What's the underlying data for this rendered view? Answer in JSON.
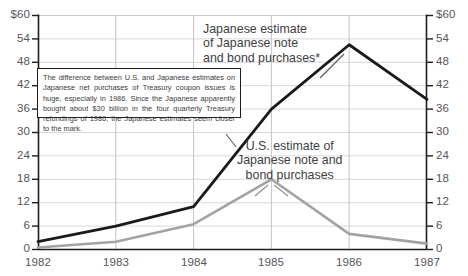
{
  "chart_data": {
    "type": "line",
    "title": "",
    "xlabel": "",
    "ylabel": "",
    "categories": [
      "1982",
      "1983",
      "1984",
      "1985",
      "1986",
      "1987"
    ],
    "ylim": [
      0,
      60
    ],
    "yticks": [
      0,
      6,
      12,
      18,
      24,
      30,
      36,
      42,
      48,
      54,
      60
    ],
    "ytick_labels_left": [
      "0",
      "6",
      "12",
      "18",
      "24",
      "30",
      "36",
      "42",
      "48",
      "54",
      "$60"
    ],
    "ytick_labels_right": [
      "0",
      "6",
      "12",
      "18",
      "24",
      "30",
      "36",
      "42",
      "48",
      "54",
      "$60"
    ],
    "grid": true,
    "legend_position": "inline-annotation",
    "series": [
      {
        "name": "Japanese estimate of Japanese note and bond purchases*",
        "color": "#1a1a1a",
        "values": [
          2,
          6,
          11,
          36,
          52.5,
          38.5
        ]
      },
      {
        "name": "U.S. estimate of Japanese note and bond purchases",
        "color": "#a3a3a3",
        "values": [
          0.5,
          2,
          6.5,
          18,
          4,
          1.5
        ]
      }
    ],
    "annotations": [
      {
        "id": "japanese-estimate-label",
        "text": "Japanese estimate\nof Japanese note\nand bond purchases*"
      },
      {
        "id": "us-estimate-label",
        "text": "U.S. estimate of\nJapanese note and\nbond purchases"
      }
    ],
    "note": "The difference between U.S. and Japanese estimates on Japanese net purchases of Treasury coupon issues is huge, especially in 1986. Since the Japanese apparently bought about $30 billion in the four quarterly Treasury refundings of 1986, the Japanese estimates seem closer to the mark."
  }
}
